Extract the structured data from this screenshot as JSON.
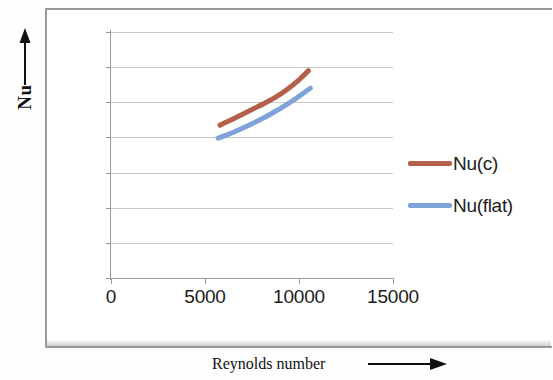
{
  "chart_data": {
    "type": "line",
    "title": "",
    "xlabel": "Reynolds number",
    "ylabel": "Nu",
    "xlim": [
      0,
      15000
    ],
    "ylim": [
      0,
      70
    ],
    "xticks": [
      0,
      5000,
      10000,
      15000
    ],
    "yticks": [
      0,
      10,
      20,
      30,
      40,
      50,
      60,
      70
    ],
    "xtick_labels": [
      "0",
      "5000",
      "10000",
      "15000"
    ],
    "ytick_labels": [
      "0",
      "10",
      "20",
      "30",
      "40",
      "50",
      "60",
      "70"
    ],
    "grid": "horizontal",
    "legend_position": "right",
    "series": [
      {
        "name": "Nu(c)",
        "color": "#b5604a",
        "x": [
          5800,
          6400,
          7000,
          7600,
          8200,
          8800,
          9400,
          10000,
          10500
        ],
        "y": [
          43.5,
          45.0,
          46.6,
          48.2,
          49.8,
          51.6,
          53.8,
          56.4,
          59.0
        ]
      },
      {
        "name": "Nu(flat)",
        "color": "#7fa3d8",
        "x": [
          5700,
          6300,
          6900,
          7500,
          8100,
          8700,
          9300,
          9900,
          10600
        ],
        "y": [
          39.8,
          41.0,
          42.4,
          43.9,
          45.5,
          47.3,
          49.2,
          51.3,
          54.0
        ]
      }
    ]
  },
  "axes": {
    "y_title": "Nu",
    "x_title": "Reynolds number",
    "y_arrow_icon": "arrow-up-icon",
    "x_arrow_icon": "arrow-right-icon"
  },
  "legend": {
    "items": [
      {
        "label": "Nu(c)",
        "color": "#b5604a"
      },
      {
        "label": "Nu(flat)",
        "color": "#7fa3d8"
      }
    ]
  },
  "colors": {
    "series_nu_c": "#b5604a",
    "series_nu_flat": "#7fa3d8",
    "gridline": "#c9c9c9",
    "axis": "#9b9b9b",
    "frame": "#9a9a9a",
    "text": "#1c1c1c"
  }
}
